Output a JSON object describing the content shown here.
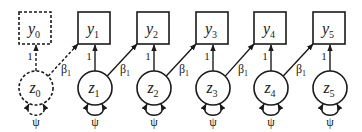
{
  "diagram": {
    "type": "path-model",
    "style": {
      "stroke": "#1a1a1a",
      "background": "#ffffff"
    },
    "columns": [
      {
        "observed": {
          "name": "y",
          "sub": "0"
        },
        "latent": {
          "name": "z",
          "sub": "0"
        },
        "loading": "1",
        "variance": "ψ",
        "dashed": true
      },
      {
        "observed": {
          "name": "y",
          "sub": "1"
        },
        "latent": {
          "name": "z",
          "sub": "1"
        },
        "loading": "1",
        "variance": "ψ",
        "dashed": false
      },
      {
        "observed": {
          "name": "y",
          "sub": "2"
        },
        "latent": {
          "name": "z",
          "sub": "2"
        },
        "loading": "1",
        "variance": "ψ",
        "dashed": false
      },
      {
        "observed": {
          "name": "y",
          "sub": "3"
        },
        "latent": {
          "name": "z",
          "sub": "3"
        },
        "loading": "1",
        "variance": "ψ",
        "dashed": false
      },
      {
        "observed": {
          "name": "y",
          "sub": "4"
        },
        "latent": {
          "name": "z",
          "sub": "4"
        },
        "loading": "1",
        "variance": "ψ",
        "dashed": false
      },
      {
        "observed": {
          "name": "y",
          "sub": "5"
        },
        "latent": {
          "name": "z",
          "sub": "5"
        },
        "loading": "1",
        "variance": "ψ",
        "dashed": false
      }
    ],
    "cross_paths": [
      {
        "from": "z0",
        "to": "y1",
        "label": "β",
        "label_sub": "1",
        "dashed": true
      },
      {
        "from": "z1",
        "to": "y2",
        "label": "β",
        "label_sub": "1",
        "dashed": false
      },
      {
        "from": "z2",
        "to": "y3",
        "label": "β",
        "label_sub": "1",
        "dashed": false
      },
      {
        "from": "z3",
        "to": "y4",
        "label": "β",
        "label_sub": "1",
        "dashed": false
      },
      {
        "from": "z4",
        "to": "y5",
        "label": "β",
        "label_sub": "1",
        "dashed": false
      }
    ]
  }
}
